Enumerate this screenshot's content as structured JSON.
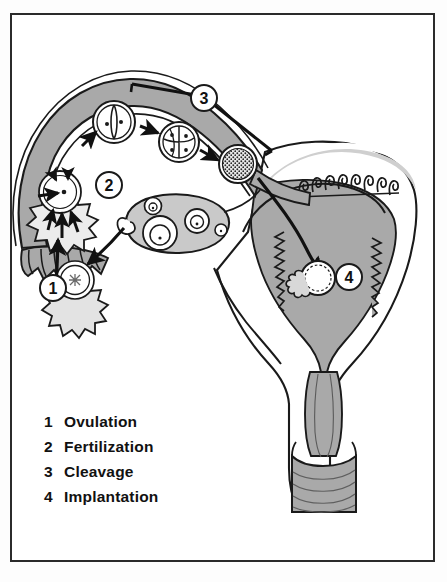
{
  "figure": {
    "border_color": "#2b2b2b",
    "background_color": "#ffffff",
    "tissue_fill": "#a9a9a9",
    "tissue_fill_light": "#c9c9c9",
    "outline_color": "#1a1a1a"
  },
  "legend": {
    "items": [
      {
        "number": "1",
        "label": "Ovulation"
      },
      {
        "number": "2",
        "label": "Fertilization"
      },
      {
        "number": "3",
        "label": "Cleavage"
      },
      {
        "number": "4",
        "label": "Implantation"
      }
    ]
  },
  "callouts": [
    {
      "number": "1",
      "name": "callout-ovulation",
      "x": 53,
      "y": 288
    },
    {
      "number": "2",
      "name": "callout-fertilization",
      "x": 109,
      "y": 185
    },
    {
      "number": "3",
      "name": "callout-cleavage",
      "x": 204,
      "y": 98
    },
    {
      "number": "4",
      "name": "callout-implantation",
      "x": 349,
      "y": 277
    }
  ],
  "structures": [
    {
      "name": "ovary",
      "label": "ovary with developing follicles"
    },
    {
      "name": "fimbriae",
      "label": "fimbriae of fallopian tube"
    },
    {
      "name": "infundibulum",
      "label": "infundibulum"
    },
    {
      "name": "fallopian-tube",
      "label": "fallopian tube (oviduct)"
    },
    {
      "name": "uterus",
      "label": "uterus"
    },
    {
      "name": "endometrium",
      "label": "endometrial lining"
    },
    {
      "name": "cervix",
      "label": "cervix"
    },
    {
      "name": "vagina",
      "label": "vagina"
    }
  ],
  "embryo_stages": [
    {
      "name": "ovum-corona-radiata",
      "stage": "ovulated ovum with corona radiata",
      "x": 75,
      "y": 278
    },
    {
      "name": "fertilized-ovum",
      "stage": "fertilization of ovum by sperm",
      "x": 60,
      "y": 190
    },
    {
      "name": "two-cell-stage",
      "stage": "2-cell stage",
      "x": 114,
      "y": 122
    },
    {
      "name": "four-cell-stage",
      "stage": "4-cell stage",
      "x": 179,
      "y": 142
    },
    {
      "name": "morula",
      "stage": "morula",
      "x": 238,
      "y": 164
    },
    {
      "name": "blastocyst",
      "stage": "implanting blastocyst",
      "x": 318,
      "y": 278
    }
  ]
}
